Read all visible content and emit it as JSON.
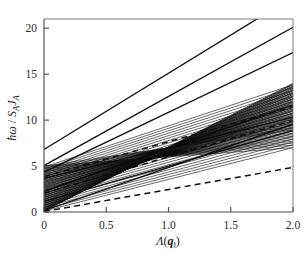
{
  "chart_data": {
    "type": "line",
    "title": "",
    "xlabel": "Λ(q‖)",
    "ylabel": "ħω / S_A J_A",
    "xlim": [
      0,
      2.0
    ],
    "ylim": [
      0,
      21
    ],
    "xticks": [
      0,
      0.5,
      1.0,
      1.5,
      2.0
    ],
    "xticklabels": [
      "0",
      "0.5",
      "1.0",
      "1.5",
      "2.0"
    ],
    "yticks": [
      0,
      5,
      10,
      15,
      20
    ],
    "yticklabels": [
      "0",
      "5",
      "10",
      "15",
      "20"
    ],
    "grid": false,
    "legend": null,
    "series": [
      {
        "name": "branch-top-1",
        "style": "solid",
        "x": [
          0,
          2.0
        ],
        "y": [
          6.8,
          23.4
        ]
      },
      {
        "name": "branch-top-2",
        "style": "solid",
        "x": [
          0,
          2.0
        ],
        "y": [
          5.05,
          20.1
        ]
      },
      {
        "name": "branch-top-3",
        "style": "solid",
        "x": [
          0,
          2.0
        ],
        "y": [
          4.35,
          17.35
        ]
      },
      {
        "name": "branch-mid-1",
        "style": "solid",
        "x": [
          0,
          2.0
        ],
        "y": [
          3.65,
          10.3
        ]
      },
      {
        "name": "branch-mid-2",
        "style": "solid",
        "x": [
          0,
          2.0
        ],
        "y": [
          2.25,
          11.65
        ]
      },
      {
        "name": "branch-mid-3",
        "style": "solid",
        "x": [
          0,
          2.0
        ],
        "y": [
          1.15,
          8.85
        ]
      },
      {
        "name": "branch-mid-4",
        "style": "solid",
        "x": [
          0,
          2.0
        ],
        "y": [
          0.15,
          9.55
        ]
      },
      {
        "name": "dashed-upper",
        "style": "dashed",
        "x": [
          0,
          2.0
        ],
        "y": [
          3.85,
          11.45
        ]
      },
      {
        "name": "dashed-middle",
        "style": "dashed",
        "x": [
          0,
          2.0
        ],
        "y": [
          2.05,
          9.95
        ]
      },
      {
        "name": "dashed-lower",
        "style": "dashed",
        "x": [
          0,
          2.0
        ],
        "y": [
          0.05,
          4.85
        ]
      },
      {
        "name": "dense-band",
        "style": "dense-band",
        "x": [
          0,
          2.0
        ],
        "y_intercept_range": [
          0.1,
          5.0
        ],
        "y_end_range": [
          7.0,
          14.0
        ],
        "count": 46
      }
    ],
    "annotations": []
  }
}
